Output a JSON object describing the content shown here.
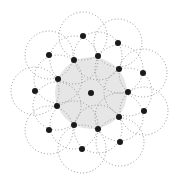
{
  "diagram": {
    "type": "disk-coverage",
    "width": 177,
    "height": 182,
    "colors": {
      "background": "#ffffff",
      "dot": "#1a1a1a",
      "circle_stroke": "#8a8a8a",
      "shaded_region": "#e6e6e6"
    },
    "shaded_region": {
      "cx": 91,
      "cy": 93,
      "r": 36
    },
    "circle_radius": 24,
    "dot_radius": 3,
    "center_dot": {
      "x": 91,
      "y": 93
    },
    "dots": [
      {
        "x": 83,
        "y": 36
      },
      {
        "x": 118,
        "y": 43
      },
      {
        "x": 49,
        "y": 55
      },
      {
        "x": 98,
        "y": 56
      },
      {
        "x": 74,
        "y": 60
      },
      {
        "x": 119,
        "y": 69
      },
      {
        "x": 143,
        "y": 73
      },
      {
        "x": 58,
        "y": 79
      },
      {
        "x": 35,
        "y": 91
      },
      {
        "x": 128,
        "y": 92
      },
      {
        "x": 57,
        "y": 106
      },
      {
        "x": 144,
        "y": 111
      },
      {
        "x": 119,
        "y": 117
      },
      {
        "x": 74,
        "y": 125
      },
      {
        "x": 98,
        "y": 129
      },
      {
        "x": 49,
        "y": 130
      },
      {
        "x": 120,
        "y": 142
      },
      {
        "x": 82,
        "y": 149
      }
    ]
  }
}
